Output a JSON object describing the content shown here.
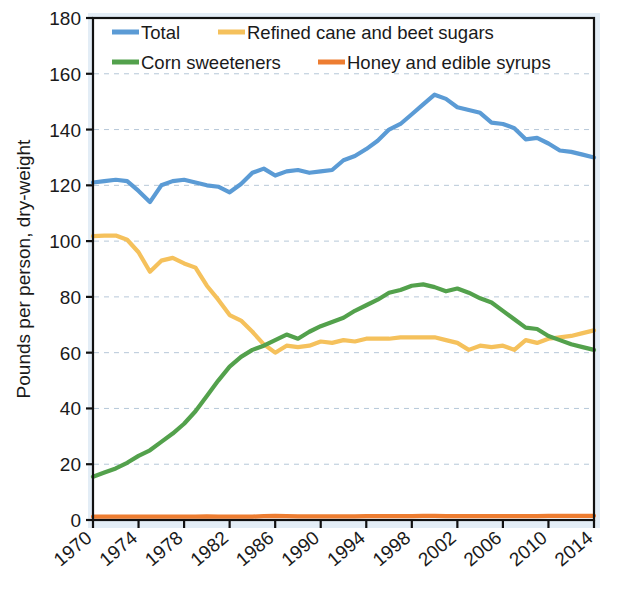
{
  "chart_data": {
    "type": "line",
    "title": "",
    "subtitle": "",
    "xlabel": "",
    "ylabel": "Pounds per person, dry-weight",
    "xlim": [
      1970,
      2014
    ],
    "ylim": [
      0,
      180
    ],
    "ytick_step": 20,
    "xtick_step": 4,
    "grid": true,
    "grid_axis": "y",
    "grid_style": "dashed",
    "legend_position": "top-inside",
    "legend_columns": 2,
    "x": [
      1970,
      1971,
      1972,
      1973,
      1974,
      1975,
      1976,
      1977,
      1978,
      1979,
      1980,
      1981,
      1982,
      1983,
      1984,
      1985,
      1986,
      1987,
      1988,
      1989,
      1990,
      1991,
      1992,
      1993,
      1994,
      1995,
      1996,
      1997,
      1998,
      1999,
      2000,
      2001,
      2002,
      2003,
      2004,
      2005,
      2006,
      2007,
      2008,
      2009,
      2010,
      2011,
      2012,
      2013,
      2014
    ],
    "xtick_labels": [
      "1970",
      "1974",
      "1978",
      "1982",
      "1986",
      "1990",
      "1994",
      "1998",
      "2002",
      "2006",
      "2010",
      "2014"
    ],
    "ytick_labels": [
      "0",
      "20",
      "40",
      "60",
      "80",
      "100",
      "120",
      "140",
      "160",
      "180"
    ],
    "series": [
      {
        "name": "Total",
        "color": "#5B9BD5",
        "values": [
          121.0,
          121.5,
          122.0,
          121.5,
          118.0,
          114.0,
          120.0,
          121.5,
          122.0,
          121.0,
          120.0,
          119.5,
          117.5,
          120.5,
          124.5,
          126.0,
          123.5,
          125.0,
          125.5,
          124.5,
          125.0,
          125.5,
          129.0,
          130.5,
          133.0,
          136.0,
          140.0,
          142.0,
          145.5,
          149.0,
          152.5,
          151.0,
          148.0,
          147.0,
          146.0,
          142.5,
          142.0,
          140.5,
          136.5,
          137.0,
          135.0,
          132.5,
          132.0,
          131.0,
          130.0
        ]
      },
      {
        "name": "Refined cane and beet sugars",
        "color": "#F5C15C",
        "values": [
          101.8,
          102.0,
          102.0,
          100.5,
          96.0,
          89.0,
          93.0,
          94.0,
          92.0,
          90.5,
          84.0,
          79.0,
          73.5,
          71.5,
          67.5,
          63.0,
          60.0,
          62.5,
          62.0,
          62.5,
          64.0,
          63.5,
          64.5,
          64.0,
          65.0,
          65.0,
          65.0,
          65.5,
          65.5,
          65.5,
          65.5,
          64.5,
          63.5,
          61.0,
          62.5,
          62.0,
          62.5,
          61.0,
          64.5,
          63.5,
          65.0,
          65.5,
          66.0,
          67.0,
          68.0
        ]
      },
      {
        "name": "Corn sweeteners",
        "color": "#53A14C",
        "values": [
          15.5,
          17.0,
          18.5,
          20.5,
          23.0,
          25.0,
          28.0,
          31.0,
          34.5,
          39.0,
          44.5,
          50.0,
          55.0,
          58.5,
          61.0,
          62.5,
          64.5,
          66.5,
          65.0,
          67.5,
          69.5,
          71.0,
          72.5,
          75.0,
          77.0,
          79.0,
          81.5,
          82.5,
          84.0,
          84.5,
          83.5,
          82.0,
          83.0,
          81.5,
          79.5,
          78.0,
          75.0,
          72.0,
          69.0,
          68.5,
          66.0,
          64.5,
          63.0,
          62.0,
          61.0
        ]
      },
      {
        "name": "Honey and edible syrups",
        "color": "#ED7D31",
        "values": [
          1.2,
          1.2,
          1.2,
          1.2,
          1.2,
          1.2,
          1.2,
          1.2,
          1.2,
          1.2,
          1.3,
          1.2,
          1.2,
          1.2,
          1.2,
          1.4,
          1.5,
          1.4,
          1.3,
          1.3,
          1.3,
          1.3,
          1.3,
          1.3,
          1.4,
          1.4,
          1.4,
          1.4,
          1.4,
          1.5,
          1.5,
          1.4,
          1.4,
          1.4,
          1.4,
          1.4,
          1.4,
          1.4,
          1.4,
          1.4,
          1.5,
          1.5,
          1.5,
          1.5,
          1.5
        ]
      }
    ]
  },
  "legend": {
    "entries": [
      {
        "label": "Total",
        "color": "#5B9BD5"
      },
      {
        "label": "Refined cane and beet sugars",
        "color": "#F5C15C"
      },
      {
        "label": "Corn sweeteners",
        "color": "#53A14C"
      },
      {
        "label": "Honey and edible syrups",
        "color": "#ED7D31"
      }
    ]
  }
}
